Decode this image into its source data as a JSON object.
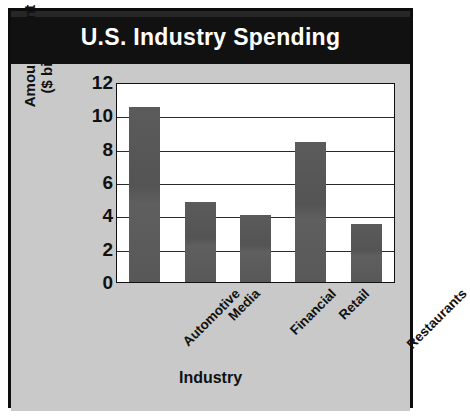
{
  "chart_data": {
    "type": "bar",
    "title": "U.S. Industry Spending",
    "xlabel": "Industry",
    "ylabel": "Amount Spent ($ billions)",
    "ylabel_line1": "Amount Spent",
    "ylabel_line2": "($ billions)",
    "categories": [
      "Automotive",
      "Media",
      "Financial",
      "Retail",
      "Restaurants"
    ],
    "values": [
      10.5,
      4.8,
      4.0,
      8.4,
      3.5
    ],
    "ylim": [
      0,
      12
    ],
    "yticks": [
      0,
      2,
      4,
      6,
      8,
      10,
      12
    ],
    "ytick_labels": [
      "0",
      "2",
      "4",
      "6",
      "8",
      "10",
      "12"
    ],
    "grid": true,
    "legend": "none",
    "colors": {
      "bar": "#585858",
      "title_band": "#111111",
      "title_text": "#ffffff",
      "background": "#c9c9c9",
      "plot_background": "#ffffff",
      "frame": "#0d0d0d",
      "axis_text": "#111111"
    }
  }
}
